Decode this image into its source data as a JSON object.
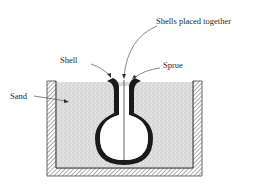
{
  "diagram": {
    "labels": {
      "shells_placed_together": "Shells placed together",
      "shell": "Shell",
      "sprue": "Sprue",
      "sand": "Sand"
    },
    "colors": {
      "shell": "#1a1a1a",
      "sand": "#d9d9d9",
      "flask_hatch": "#555555",
      "line": "#333333",
      "background": "#ffffff"
    }
  }
}
